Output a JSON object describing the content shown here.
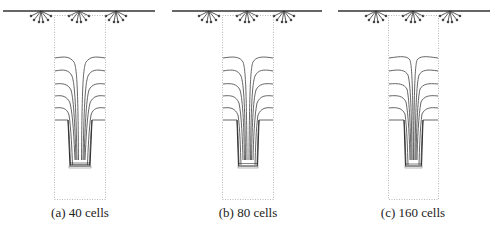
{
  "figure": {
    "panels": [
      {
        "id": "a",
        "caption": "(a) 40 cells",
        "left": 0,
        "width": 160
      },
      {
        "id": "b",
        "caption": "(b) 80 cells",
        "left": 168,
        "width": 160
      },
      {
        "id": "c",
        "caption": "(c) 160 cells",
        "left": 334,
        "width": 158
      }
    ],
    "elements": {
      "top_boundary": "surface-line",
      "sources": [
        "fan-source-left",
        "fan-source-center",
        "fan-source-right"
      ],
      "domain_box": "dotted-rectangle",
      "contours": "level-lines",
      "tube": "narrow-column"
    },
    "colors": {
      "line": "#333333",
      "contour": "#555555",
      "dotted": "#999999",
      "text": "#222222"
    }
  }
}
